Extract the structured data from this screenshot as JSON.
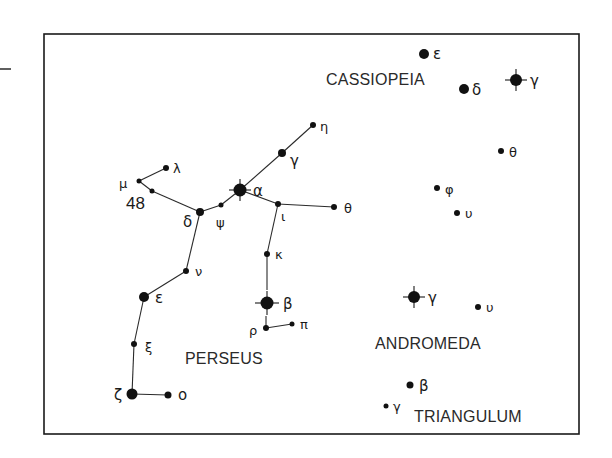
{
  "diagram": {
    "type": "star_chart",
    "frame": {
      "x": 44,
      "y": 34,
      "width": 535,
      "height": 400
    },
    "margin_mark": {
      "x1": 0,
      "y1": 69,
      "x2": 11,
      "y2": 69
    },
    "constellations": [
      {
        "id": "cassiopeia",
        "name": "CASSIOPEIA",
        "label_x": 326,
        "label_y": 85
      },
      {
        "id": "perseus",
        "name": "PERSEUS",
        "label_x": 185,
        "label_y": 364
      },
      {
        "id": "andromeda",
        "name": "ANDROMEDA",
        "label_x": 375,
        "label_y": 349
      },
      {
        "id": "triangulum",
        "name": "TRIANGULUM",
        "label_x": 414,
        "label_y": 422
      }
    ],
    "stars": [
      {
        "id": "cas-epsilon",
        "constellation": "cassiopeia",
        "label": "ε",
        "x": 424,
        "y": 54,
        "r": 5,
        "spikes": 0,
        "lx": 433,
        "ly": 59
      },
      {
        "id": "cas-delta",
        "constellation": "cassiopeia",
        "label": "δ",
        "x": 464,
        "y": 89,
        "r": 5,
        "spikes": 0,
        "lx": 472,
        "ly": 95
      },
      {
        "id": "cas-gamma",
        "constellation": "cassiopeia",
        "label": "γ",
        "x": 516,
        "y": 80,
        "r": 6,
        "spikes": 11,
        "lx": 530,
        "ly": 86
      },
      {
        "id": "per-eta",
        "constellation": "perseus",
        "label": "η",
        "x": 313,
        "y": 125,
        "r": 3,
        "spikes": 0,
        "lx": 320,
        "ly": 131
      },
      {
        "id": "per-gamma",
        "constellation": "perseus",
        "label": "γ",
        "x": 282,
        "y": 153,
        "r": 4,
        "spikes": 0,
        "lx": 290,
        "ly": 166
      },
      {
        "id": "per-alpha",
        "constellation": "perseus",
        "label": "α",
        "x": 240,
        "y": 190,
        "r": 6.5,
        "spikes": 11,
        "lx": 253,
        "ly": 196
      },
      {
        "id": "per-psi",
        "constellation": "perseus",
        "label": "ψ",
        "x": 221,
        "y": 205,
        "r": 2.5,
        "spikes": 0,
        "lx": 216,
        "ly": 227
      },
      {
        "id": "per-delta",
        "constellation": "perseus",
        "label": "δ",
        "x": 200,
        "y": 212,
        "r": 4,
        "spikes": 0,
        "lx": 183,
        "ly": 227
      },
      {
        "id": "per-48",
        "constellation": "perseus",
        "label": "48",
        "x": 152,
        "y": 191,
        "r": 2.5,
        "spikes": 0,
        "lx": 126,
        "ly": 209,
        "numeric": true
      },
      {
        "id": "per-mu",
        "constellation": "perseus",
        "label": "μ",
        "x": 139,
        "y": 181,
        "r": 2.5,
        "spikes": 0,
        "lx": 119,
        "ly": 188
      },
      {
        "id": "per-lambda",
        "constellation": "perseus",
        "label": "λ",
        "x": 166,
        "y": 168,
        "r": 3,
        "spikes": 0,
        "lx": 173,
        "ly": 173
      },
      {
        "id": "per-iota",
        "constellation": "perseus",
        "label": "ι",
        "x": 278,
        "y": 204,
        "r": 3,
        "spikes": 0,
        "lx": 281,
        "ly": 221
      },
      {
        "id": "per-theta",
        "constellation": "perseus",
        "label": "θ",
        "x": 334,
        "y": 207,
        "r": 3,
        "spikes": 0,
        "lx": 344,
        "ly": 213
      },
      {
        "id": "per-kappa",
        "constellation": "perseus",
        "label": "κ",
        "x": 267,
        "y": 254,
        "r": 3,
        "spikes": 0,
        "lx": 275,
        "ly": 259
      },
      {
        "id": "per-beta",
        "constellation": "perseus",
        "label": "β",
        "x": 267,
        "y": 303,
        "r": 6.5,
        "spikes": 12,
        "lx": 283,
        "ly": 309
      },
      {
        "id": "per-rho",
        "constellation": "perseus",
        "label": "ρ",
        "x": 266,
        "y": 328,
        "r": 3,
        "spikes": 0,
        "lx": 249,
        "ly": 335
      },
      {
        "id": "per-pi",
        "constellation": "perseus",
        "label": "π",
        "x": 292,
        "y": 324,
        "r": 2.5,
        "spikes": 0,
        "lx": 300,
        "ly": 329
      },
      {
        "id": "per-nu",
        "constellation": "perseus",
        "label": "ν",
        "x": 186,
        "y": 271,
        "r": 3,
        "spikes": 0,
        "lx": 195,
        "ly": 276
      },
      {
        "id": "per-epsilon",
        "constellation": "perseus",
        "label": "ε",
        "x": 144,
        "y": 297,
        "r": 5,
        "spikes": 0,
        "lx": 155,
        "ly": 303
      },
      {
        "id": "per-xi",
        "constellation": "perseus",
        "label": "ξ",
        "x": 134,
        "y": 344,
        "r": 3,
        "spikes": 0,
        "lx": 145,
        "ly": 352
      },
      {
        "id": "per-zeta",
        "constellation": "perseus",
        "label": "ζ",
        "x": 132,
        "y": 394,
        "r": 5.5,
        "spikes": 0,
        "lx": 114,
        "ly": 400
      },
      {
        "id": "per-omicron",
        "constellation": "perseus",
        "label": "ο",
        "x": 168,
        "y": 395,
        "r": 3.5,
        "spikes": 0,
        "lx": 178,
        "ly": 400
      },
      {
        "id": "and-theta",
        "constellation": "andromeda",
        "label": "θ",
        "x": 501,
        "y": 151,
        "r": 3,
        "spikes": 0,
        "lx": 509,
        "ly": 157
      },
      {
        "id": "and-phi",
        "constellation": "andromeda",
        "label": "φ",
        "x": 437,
        "y": 188,
        "r": 3,
        "spikes": 0,
        "lx": 445,
        "ly": 194
      },
      {
        "id": "and-upsilon-1",
        "constellation": "andromeda",
        "label": "υ",
        "x": 457,
        "y": 213,
        "r": 3,
        "spikes": 0,
        "lx": 465,
        "ly": 218
      },
      {
        "id": "and-gamma",
        "constellation": "andromeda",
        "label": "γ",
        "x": 414,
        "y": 297,
        "r": 6,
        "spikes": 11,
        "lx": 428,
        "ly": 303
      },
      {
        "id": "and-upsilon-2",
        "constellation": "andromeda",
        "label": "υ",
        "x": 478,
        "y": 307,
        "r": 3,
        "spikes": 0,
        "lx": 486,
        "ly": 312
      },
      {
        "id": "tri-beta",
        "constellation": "triangulum",
        "label": "β",
        "x": 410,
        "y": 385,
        "r": 3.5,
        "spikes": 0,
        "lx": 419,
        "ly": 391
      },
      {
        "id": "tri-gamma",
        "constellation": "triangulum",
        "label": "γ",
        "x": 386,
        "y": 406,
        "r": 2.5,
        "spikes": 0,
        "lx": 393,
        "ly": 411
      }
    ],
    "lines": [
      [
        "per-eta",
        "per-gamma"
      ],
      [
        "per-gamma",
        "per-alpha"
      ],
      [
        "per-alpha",
        "per-psi"
      ],
      [
        "per-psi",
        "per-delta"
      ],
      [
        "per-delta",
        "per-48"
      ],
      [
        "per-48",
        "per-mu"
      ],
      [
        "per-mu",
        "per-lambda"
      ],
      [
        "per-alpha",
        "per-iota"
      ],
      [
        "per-iota",
        "per-theta"
      ],
      [
        "per-iota",
        "per-kappa"
      ],
      [
        "per-delta",
        "per-nu"
      ],
      [
        "per-nu",
        "per-epsilon"
      ],
      [
        "per-epsilon",
        "per-xi"
      ],
      [
        "per-xi",
        "per-zeta"
      ],
      [
        "per-zeta",
        "per-omicron"
      ],
      [
        "per-rho",
        "per-pi"
      ]
    ],
    "partial_lines": [
      {
        "from": "per-kappa",
        "x2": 267,
        "y2": 290
      },
      {
        "from": "per-rho",
        "x2": 266,
        "y2": 316
      }
    ]
  }
}
